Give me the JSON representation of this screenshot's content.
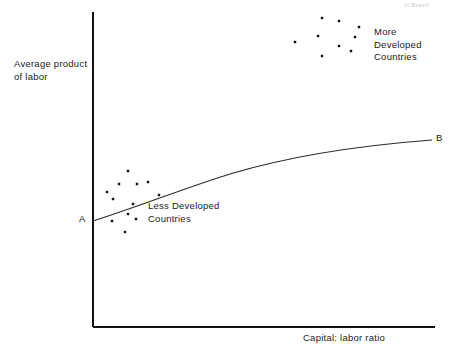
{
  "figure": {
    "title_fragment": "in Brazil",
    "background": "#ffffff",
    "ink_color": "#111111"
  },
  "axes": {
    "y_label": "Average product\nof labor",
    "x_label": "Capital: labor ratio",
    "y_axis": {
      "x": 93,
      "y_top": 12,
      "y_bottom": 327
    },
    "x_axis": {
      "y": 327,
      "x_left": 93,
      "x_right": 435
    }
  },
  "curve": {
    "name": "production-function-curve",
    "start_label": "A",
    "end_label": "B",
    "start_point": {
      "x": 93,
      "y": 221
    },
    "end_point": {
      "x": 432,
      "y": 140
    },
    "path": "M 93 221 C 140 206, 185 188, 230 174 C 280 159, 340 147, 432 140"
  },
  "annotations": {
    "more_developed": "More\nDeveloped\nCountries",
    "less_developed": "Less Developed\nCountries"
  },
  "chart_data": {
    "type": "scatter",
    "title": "",
    "xlabel": "Capital: labor ratio",
    "ylabel": "Average product of labor",
    "grid": false,
    "axis_ticks": false,
    "legend": "inline-annotations",
    "xlim": [
      93,
      435
    ],
    "ylim": [
      327,
      12
    ],
    "note": "Coordinates are pixel positions in the 455x354 figure; y increases downward.",
    "series": [
      {
        "name": "More Developed Countries",
        "label": "More\nDeveloped\nCountries",
        "label_position": {
          "x": 374,
          "y": 26
        },
        "marker": "square",
        "marker_size": 2.4,
        "color": "#101010",
        "points": [
          {
            "x": 322,
            "y": 18
          },
          {
            "x": 339,
            "y": 21
          },
          {
            "x": 359,
            "y": 27
          },
          {
            "x": 318,
            "y": 36
          },
          {
            "x": 355,
            "y": 37
          },
          {
            "x": 295,
            "y": 42
          },
          {
            "x": 339,
            "y": 46
          },
          {
            "x": 351,
            "y": 51
          },
          {
            "x": 322,
            "y": 56
          }
        ]
      },
      {
        "name": "Less Developed Countries",
        "label": "Less Developed\nCountries",
        "label_position": {
          "x": 148,
          "y": 200
        },
        "marker": "square",
        "marker_size": 2.4,
        "color": "#101010",
        "points": [
          {
            "x": 128,
            "y": 171
          },
          {
            "x": 148,
            "y": 182
          },
          {
            "x": 119,
            "y": 184
          },
          {
            "x": 137,
            "y": 184
          },
          {
            "x": 107,
            "y": 192
          },
          {
            "x": 113,
            "y": 199
          },
          {
            "x": 133,
            "y": 204
          },
          {
            "x": 159,
            "y": 195
          },
          {
            "x": 128,
            "y": 214
          },
          {
            "x": 112,
            "y": 221
          },
          {
            "x": 136,
            "y": 219
          },
          {
            "x": 125,
            "y": 232
          }
        ]
      }
    ],
    "curve": {
      "name": "Average product of labor function",
      "start_label": "A",
      "end_label": "B",
      "shape": "concave increasing, flattening toward B"
    }
  }
}
